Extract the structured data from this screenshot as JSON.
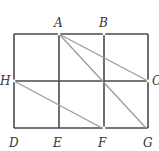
{
  "diagram": {
    "type": "geometry-grid",
    "colors": {
      "grid": "#4a4a4a",
      "diagonals": "#9a9a9a",
      "labels": "#333333",
      "background": "#ffffff"
    },
    "points": {
      "A": {
        "label": "A",
        "x": 59,
        "y": 34
      },
      "B": {
        "label": "B",
        "x": 104,
        "y": 34
      },
      "C": {
        "label": "C",
        "x": 148,
        "y": 81
      },
      "H": {
        "label": "H",
        "x": 14,
        "y": 81
      },
      "D": {
        "label": "D",
        "x": 14,
        "y": 128
      },
      "E": {
        "label": "E",
        "x": 59,
        "y": 128
      },
      "F": {
        "label": "F",
        "x": 104,
        "y": 128
      },
      "G": {
        "label": "G",
        "x": 148,
        "y": 128
      }
    },
    "grid_segments": [
      "top edge",
      "bottom edge",
      "left edge",
      "right edge",
      "middle horizontal H-C",
      "vertical A-E",
      "vertical B-F"
    ],
    "diagonal_segments": [
      {
        "from": "A",
        "to": "C"
      },
      {
        "from": "A",
        "to": "G"
      },
      {
        "from": "H",
        "to": "F"
      }
    ]
  }
}
